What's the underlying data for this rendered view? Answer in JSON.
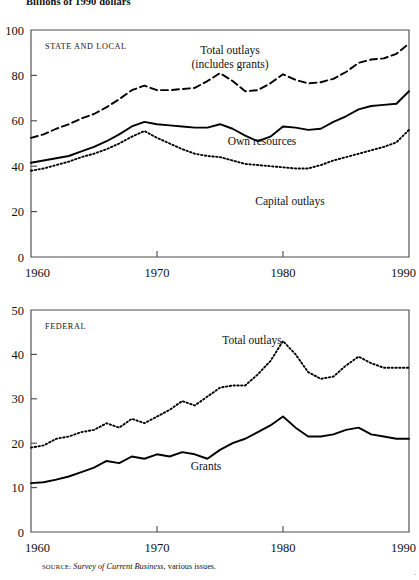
{
  "figure": {
    "title": "Billions of 1990 dollars",
    "source_label": "SOURCE:",
    "source_italic": "Survey of Current Business",
    "source_rest": ", various issues.",
    "corner_mark": "·"
  },
  "chart_data": [
    {
      "type": "line",
      "title": "",
      "panel_label": "STATE AND LOCAL",
      "xlabel": "",
      "ylabel": "Billions of 1990 dollars",
      "xlim": [
        1960,
        1990
      ],
      "ylim": [
        0,
        100
      ],
      "xticks": [
        1960,
        1970,
        1980,
        1990
      ],
      "yticks": [
        0,
        20,
        40,
        60,
        80,
        100
      ],
      "xtick_labels": [
        "1960",
        "1970",
        "1980",
        "1990"
      ],
      "ytick_labels": [
        "0",
        "20",
        "40",
        "60",
        "80",
        "100"
      ],
      "grid": false,
      "legend": "inline-annotations",
      "x": [
        1960,
        1961,
        1962,
        1963,
        1964,
        1965,
        1966,
        1967,
        1968,
        1969,
        1970,
        1971,
        1972,
        1973,
        1974,
        1975,
        1976,
        1977,
        1978,
        1979,
        1980,
        1981,
        1982,
        1983,
        1984,
        1985,
        1986,
        1987,
        1988,
        1989,
        1990
      ],
      "series": [
        {
          "name": "Total outlays (includes grants)",
          "style": "dashed",
          "label_line1": "Total outlays",
          "label_line2": "(includes grants)",
          "values": [
            52.5,
            54.0,
            56.5,
            58.5,
            61.0,
            63.0,
            66.0,
            69.5,
            73.5,
            75.5,
            73.5,
            73.5,
            74.0,
            74.5,
            77.5,
            81.0,
            77.5,
            73.0,
            73.5,
            76.5,
            80.5,
            78.0,
            76.5,
            77.0,
            78.5,
            81.5,
            85.5,
            87.0,
            87.5,
            89.5,
            94.0
          ]
        },
        {
          "name": "Own resources",
          "style": "solid",
          "label": "Own resources",
          "values": [
            41.5,
            42.5,
            43.5,
            44.5,
            46.5,
            48.5,
            51.0,
            54.0,
            57.5,
            59.5,
            58.5,
            58.0,
            57.5,
            57.0,
            57.0,
            58.5,
            56.5,
            53.5,
            51.0,
            53.0,
            57.5,
            57.0,
            56.0,
            56.5,
            59.5,
            62.0,
            65.0,
            66.5,
            67.0,
            67.5,
            73.0
          ]
        },
        {
          "name": "Capital outlays",
          "style": "dotted",
          "label": "Capital outlays",
          "values": [
            38.0,
            39.0,
            40.5,
            42.0,
            44.0,
            45.5,
            47.5,
            50.0,
            53.0,
            55.5,
            52.5,
            50.0,
            47.5,
            45.5,
            44.5,
            44.0,
            42.5,
            41.0,
            40.5,
            40.0,
            39.5,
            39.0,
            39.0,
            40.5,
            42.5,
            44.0,
            45.5,
            47.0,
            48.5,
            50.5,
            56.0
          ]
        }
      ]
    },
    {
      "type": "line",
      "title": "",
      "panel_label": "FEDERAL",
      "xlabel": "",
      "ylabel": "Billions of 1990 dollars",
      "xlim": [
        1960,
        1990
      ],
      "ylim": [
        0,
        50
      ],
      "xticks": [
        1960,
        1970,
        1980,
        1990
      ],
      "yticks": [
        0,
        10,
        20,
        30,
        40,
        50
      ],
      "xtick_labels": [
        "1960",
        "1970",
        "1980",
        "1990"
      ],
      "ytick_labels": [
        "0",
        "10",
        "20",
        "30",
        "40",
        "50"
      ],
      "grid": false,
      "legend": "inline-annotations",
      "x": [
        1960,
        1961,
        1962,
        1963,
        1964,
        1965,
        1966,
        1967,
        1968,
        1969,
        1970,
        1971,
        1972,
        1973,
        1974,
        1975,
        1976,
        1977,
        1978,
        1979,
        1980,
        1981,
        1982,
        1983,
        1984,
        1985,
        1986,
        1987,
        1988,
        1989,
        1990
      ],
      "series": [
        {
          "name": "Total outlays",
          "style": "dotted",
          "label": "Total outlays",
          "values": [
            19.0,
            19.5,
            21.0,
            21.5,
            22.5,
            23.0,
            24.5,
            23.5,
            25.5,
            24.5,
            26.0,
            27.5,
            29.5,
            28.5,
            30.5,
            32.5,
            33.0,
            33.0,
            35.5,
            38.5,
            43.0,
            40.0,
            36.0,
            34.5,
            35.0,
            37.5,
            39.5,
            38.0,
            37.0,
            37.0,
            37.0
          ]
        },
        {
          "name": "Grants",
          "style": "solid",
          "label": "Grants",
          "values": [
            11.0,
            11.2,
            11.8,
            12.5,
            13.5,
            14.5,
            16.0,
            15.5,
            17.0,
            16.5,
            17.5,
            17.0,
            18.0,
            17.5,
            16.5,
            18.5,
            20.0,
            21.0,
            22.5,
            24.0,
            26.0,
            23.5,
            21.5,
            21.5,
            22.0,
            23.0,
            23.5,
            22.0,
            21.5,
            21.0,
            21.0
          ]
        }
      ]
    }
  ]
}
